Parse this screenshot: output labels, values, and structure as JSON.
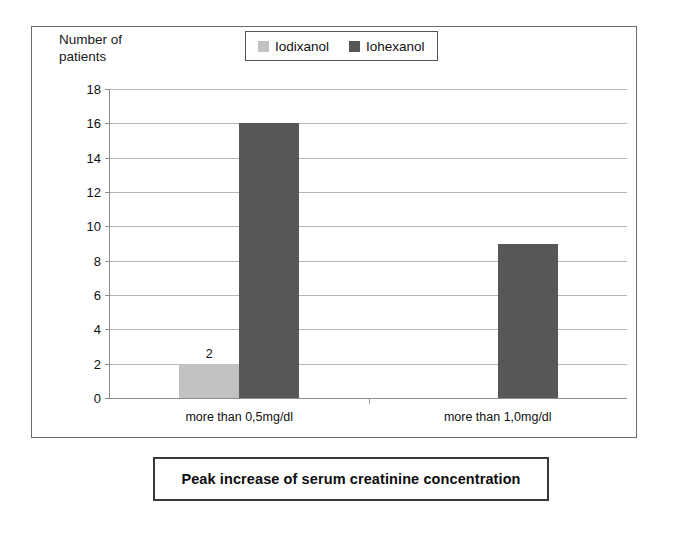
{
  "chart_data": {
    "type": "bar",
    "title": "Peak increase of serum creatinine concentration",
    "xlabel": "",
    "ylabel": "Number of\npatients",
    "categories": [
      "more than 0,5mg/dl",
      "more than 1,0mg/dl"
    ],
    "series": [
      {
        "name": "Iodixanol",
        "color": "#c2c2c2",
        "values": [
          2,
          0
        ]
      },
      {
        "name": "Iohexanol",
        "color": "#575757",
        "values": [
          16,
          9
        ]
      }
    ],
    "value_labels": [
      {
        "series": "Iodixanol",
        "category": "more than 0,5mg/dl",
        "text": "2"
      }
    ],
    "ylim": [
      0,
      18
    ],
    "y_ticks": [
      "18",
      "16",
      "14",
      "12",
      "10",
      "8",
      "6",
      "4",
      "2",
      "0"
    ],
    "y_tick_values": [
      18,
      16,
      14,
      12,
      10,
      8,
      6,
      4,
      2,
      0
    ],
    "grid": true,
    "legend_position": "top-center",
    "legend": [
      {
        "label": "Iodixanol",
        "swatch_color": "#c2c2c2"
      },
      {
        "label": "Iohexanol",
        "swatch_color": "#575757"
      }
    ]
  },
  "axis": {
    "y_title": "Number of\npatients"
  },
  "title_box": {
    "text": "Peak increase of serum creatinine concentration"
  }
}
